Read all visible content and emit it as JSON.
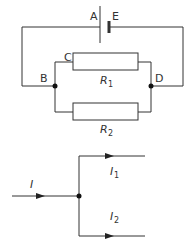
{
  "circuit": {
    "labels": {
      "A": "A",
      "E": "E",
      "B": "B",
      "C": "C",
      "D": "D",
      "R1_main": "R",
      "R1_sub": "1",
      "R2_main": "R",
      "R2_sub": "2"
    },
    "components": [
      {
        "type": "cell",
        "name": "E",
        "terminal_label": "A"
      },
      {
        "type": "resistor",
        "name": "R1",
        "between": [
          "C",
          "D"
        ]
      },
      {
        "type": "resistor",
        "name": "R2",
        "between": [
          "B",
          "D"
        ]
      }
    ],
    "nodes": [
      "B",
      "D"
    ]
  },
  "junction": {
    "labels": {
      "I_main": "I",
      "I1_main": "I",
      "I1_sub": "1",
      "I2_main": "I",
      "I2_sub": "2"
    },
    "currents": [
      {
        "name": "I",
        "direction": "in"
      },
      {
        "name": "I1",
        "direction": "out"
      },
      {
        "name": "I2",
        "direction": "out"
      }
    ]
  },
  "colors": {
    "wire": "#333333",
    "background": "#ffffff"
  }
}
